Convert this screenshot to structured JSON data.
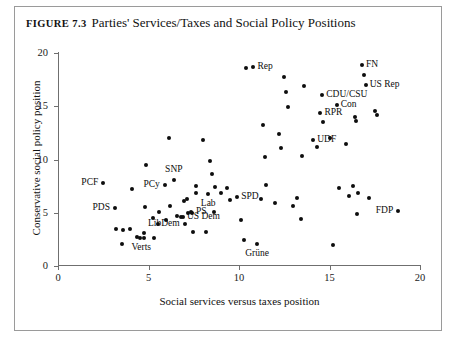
{
  "figure": {
    "number_label": "Figure 7.3",
    "title": "Parties' Services/Taxes and Social Policy Positions"
  },
  "chart_data": {
    "type": "scatter",
    "title": "Parties' Services/Taxes and Social Policy Positions",
    "xlabel": "Social services versus taxes position",
    "ylabel": "Conservative social policy position",
    "xlim": [
      0,
      20
    ],
    "ylim": [
      0,
      20
    ],
    "xticks": [
      0,
      5,
      10,
      15,
      20
    ],
    "yticks": [
      0,
      5,
      10,
      15,
      20
    ],
    "xticklabels": [
      "0",
      "5",
      "10",
      "15",
      "20"
    ],
    "yticklabels": [
      "0",
      "5",
      "10",
      "15",
      "20"
    ],
    "grid": false,
    "legend": false,
    "marker_color": "#0d0d0d",
    "axis_color": "#6f6f6f",
    "annotated_points": [
      {
        "label": "PCF",
        "x": 2.5,
        "y": 7.8,
        "label_side": "left"
      },
      {
        "label": "PDS",
        "x": 3.15,
        "y": 5.4,
        "label_side": "left"
      },
      {
        "label": "Verts",
        "x": 4.6,
        "y": 2.6,
        "label_side": "below"
      },
      {
        "label": "PCy",
        "x": 5.9,
        "y": 7.6,
        "label_side": "left"
      },
      {
        "label": "SNP",
        "x": 6.4,
        "y": 8.1,
        "label_side": "above"
      },
      {
        "label": "LibDem",
        "x": 7.0,
        "y": 3.9,
        "label_side": "left"
      },
      {
        "label": "US Dem",
        "x": 6.9,
        "y": 4.6,
        "label_side": "right"
      },
      {
        "label": "PS",
        "x": 7.4,
        "y": 5.1,
        "label_side": "right"
      },
      {
        "label": "Lab",
        "x": 8.3,
        "y": 6.8,
        "label_side": "below"
      },
      {
        "label": "SPD",
        "x": 9.9,
        "y": 6.5,
        "label_side": "right"
      },
      {
        "label": "Grüne",
        "x": 11.0,
        "y": 2.1,
        "label_side": "below"
      },
      {
        "label": "Rep",
        "x": 10.8,
        "y": 18.7,
        "label_side": "right"
      },
      {
        "label": "UDF",
        "x": 14.1,
        "y": 11.8,
        "label_side": "right"
      },
      {
        "label": "RPR",
        "x": 14.5,
        "y": 14.4,
        "label_side": "right"
      },
      {
        "label": "CDU/CSU",
        "x": 14.6,
        "y": 16.1,
        "label_side": "right"
      },
      {
        "label": "Con",
        "x": 15.4,
        "y": 15.1,
        "label_side": "right"
      },
      {
        "label": "FN",
        "x": 16.8,
        "y": 18.9,
        "label_side": "right"
      },
      {
        "label": "US Rep",
        "x": 17.0,
        "y": 17.0,
        "label_side": "right"
      },
      {
        "label": "FDP",
        "x": 18.8,
        "y": 5.2,
        "label_side": "left"
      }
    ],
    "points": [
      [
        2.5,
        7.8
      ],
      [
        3.15,
        5.4
      ],
      [
        3.2,
        3.5
      ],
      [
        3.6,
        3.4
      ],
      [
        3.55,
        2.1
      ],
      [
        4.0,
        3.5
      ],
      [
        4.1,
        7.2
      ],
      [
        4.35,
        2.7
      ],
      [
        4.55,
        2.6
      ],
      [
        4.75,
        2.6
      ],
      [
        4.75,
        3.1
      ],
      [
        4.8,
        5.5
      ],
      [
        4.85,
        9.5
      ],
      [
        5.25,
        4.5
      ],
      [
        5.3,
        2.65
      ],
      [
        5.5,
        3.9
      ],
      [
        5.6,
        5.1
      ],
      [
        5.9,
        7.6
      ],
      [
        5.95,
        4.3
      ],
      [
        6.15,
        12.0
      ],
      [
        6.2,
        5.65
      ],
      [
        6.4,
        8.1
      ],
      [
        6.55,
        4.7
      ],
      [
        6.8,
        4.6
      ],
      [
        6.9,
        4.6
      ],
      [
        6.95,
        6.1
      ],
      [
        7.0,
        3.9
      ],
      [
        7.1,
        6.3
      ],
      [
        7.2,
        5.0
      ],
      [
        7.35,
        5.1
      ],
      [
        7.4,
        5.0
      ],
      [
        7.45,
        3.2
      ],
      [
        7.6,
        7.5
      ],
      [
        7.65,
        6.9
      ],
      [
        8.0,
        11.8
      ],
      [
        8.15,
        3.2
      ],
      [
        8.3,
        6.8
      ],
      [
        8.4,
        9.9
      ],
      [
        8.5,
        8.6
      ],
      [
        8.6,
        5.1
      ],
      [
        8.7,
        7.4
      ],
      [
        9.0,
        6.9
      ],
      [
        9.35,
        7.3
      ],
      [
        9.5,
        6.2
      ],
      [
        9.9,
        6.5
      ],
      [
        10.1,
        4.3
      ],
      [
        10.3,
        2.4
      ],
      [
        10.8,
        18.7
      ],
      [
        10.4,
        18.6
      ],
      [
        11.0,
        2.1
      ],
      [
        11.2,
        6.3
      ],
      [
        11.35,
        13.2
      ],
      [
        11.45,
        10.2
      ],
      [
        11.5,
        7.6
      ],
      [
        12.0,
        5.9
      ],
      [
        12.2,
        12.4
      ],
      [
        12.3,
        11.1
      ],
      [
        12.5,
        17.7
      ],
      [
        12.6,
        16.3
      ],
      [
        12.7,
        14.9
      ],
      [
        13.0,
        5.6
      ],
      [
        13.2,
        6.4
      ],
      [
        13.4,
        4.4
      ],
      [
        13.5,
        10.3
      ],
      [
        13.6,
        16.9
      ],
      [
        14.1,
        11.8
      ],
      [
        14.3,
        11.2
      ],
      [
        14.5,
        14.4
      ],
      [
        14.6,
        16.1
      ],
      [
        14.65,
        13.5
      ],
      [
        15.0,
        12.0
      ],
      [
        15.2,
        2.0
      ],
      [
        15.4,
        15.1
      ],
      [
        15.5,
        7.3
      ],
      [
        15.9,
        11.5
      ],
      [
        16.1,
        6.6
      ],
      [
        16.3,
        7.5
      ],
      [
        16.4,
        14.0
      ],
      [
        16.45,
        13.6
      ],
      [
        16.5,
        4.9
      ],
      [
        16.6,
        6.9
      ],
      [
        16.8,
        18.9
      ],
      [
        16.9,
        17.9
      ],
      [
        17.0,
        17.0
      ],
      [
        17.2,
        6.4
      ],
      [
        17.5,
        14.6
      ],
      [
        17.6,
        14.2
      ],
      [
        18.8,
        5.2
      ]
    ]
  }
}
